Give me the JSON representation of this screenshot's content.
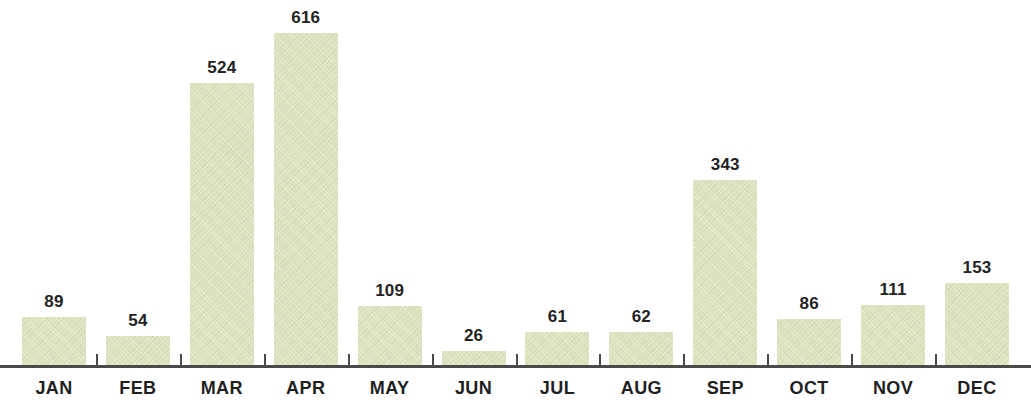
{
  "chart_data": {
    "type": "bar",
    "title": "",
    "subtitle": "",
    "xlabel": "",
    "ylabel": "",
    "categories": [
      "JAN",
      "FEB",
      "MAR",
      "APR",
      "MAY",
      "JUN",
      "JUL",
      "AUG",
      "SEP",
      "OCT",
      "NOV",
      "DEC"
    ],
    "values": [
      89,
      54,
      524,
      616,
      109,
      26,
      61,
      62,
      343,
      86,
      111,
      153
    ],
    "value_labels": [
      "89",
      "54",
      "524",
      "616",
      "109",
      "26",
      "61",
      "62",
      "343",
      "86",
      "111",
      "153"
    ],
    "ylim": [
      0,
      616
    ],
    "grid": false,
    "legend": null,
    "legend_position": "none",
    "annotations": "Data value printed above each bar",
    "axis": {
      "y_axis_visible": false,
      "x_axis_visible": true,
      "tick_labels": [
        "JAN",
        "FEB",
        "MAR",
        "APR",
        "MAY",
        "JUN",
        "JUL",
        "AUG",
        "SEP",
        "OCT",
        "NOV",
        "DEC"
      ],
      "tick_marks_between_bars": true
    }
  },
  "style": {
    "bar_color": "#d9e2bb",
    "axis_color": "#4a4a4a",
    "value_label_color": "#232323",
    "month_label_color": "#1f1f1f",
    "background_color": "#ffffff"
  }
}
